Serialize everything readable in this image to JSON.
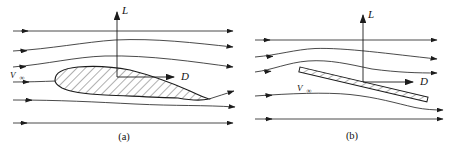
{
  "figure": {
    "type": "streamline-diagram",
    "background": "#ffffff",
    "line_color": "#1c1c1c",
    "panels": [
      {
        "id": "a",
        "body": "airfoil",
        "caption": "(a)",
        "lift_label": "L",
        "drag_label": "D",
        "velocity_label": "V",
        "velocity_subscript": "∞"
      },
      {
        "id": "b",
        "body": "flat-plate",
        "caption": "(b)",
        "lift_label": "L",
        "drag_label": "D",
        "velocity_label": "V",
        "velocity_subscript": "∞"
      }
    ]
  }
}
